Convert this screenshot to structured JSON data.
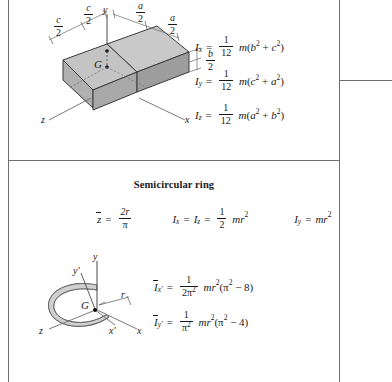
{
  "page": {
    "panels": [
      {
        "id": "rectangular-prism",
        "title": "",
        "figure": {
          "axis_labels": [
            "y",
            "z",
            "x"
          ],
          "centroid_label": "G",
          "dimensions": [
            {
              "label": "c/2",
              "num": "c",
              "den": "2"
            },
            {
              "label": "c/2",
              "num": "c",
              "den": "2"
            },
            {
              "label": "a/2",
              "num": "a",
              "den": "2"
            },
            {
              "label": "a/2",
              "num": "a",
              "den": "2"
            },
            {
              "label": "b/2",
              "num": "b",
              "den": "2"
            }
          ],
          "colors": {
            "top_face": "#c9c9c9",
            "left_face": "#b0b0b0",
            "front_face": "#a3a3a3",
            "outline": "#3a3a3a"
          }
        },
        "formulas": [
          {
            "lhs": "I",
            "sub": "x",
            "coef_num": "1",
            "coef_den": "12",
            "rhs": "m(b2 + c2)"
          },
          {
            "lhs": "I",
            "sub": "y",
            "coef_num": "1",
            "coef_den": "12",
            "rhs": "m(c2 + a2)"
          },
          {
            "lhs": "I",
            "sub": "z",
            "coef_num": "1",
            "coef_den": "12",
            "rhs": "m(a2 + b2)"
          }
        ]
      },
      {
        "id": "semicircular-ring",
        "title": "Semicircular ring",
        "figure": {
          "axis_labels": [
            "y",
            "y'",
            "z",
            "x'",
            "x"
          ],
          "centroid_label": "G",
          "radius_label": "r",
          "colors": {
            "band_fill": "#d0d0d0",
            "outline": "#555555"
          }
        },
        "row1": [
          {
            "lhs": "z",
            "overbar": true,
            "num": "2r",
            "den": "π"
          },
          {
            "lhs": "Ix = Iz",
            "num": "1",
            "den": "2",
            "rhs": "mr2"
          },
          {
            "lhs": "Iy",
            "rhs": "mr2"
          }
        ],
        "formulas": [
          {
            "lhs": "I",
            "sub": "x'",
            "overbar": true,
            "num": "1",
            "den": "2π2",
            "rhs": "mr2(π2 − 8)"
          },
          {
            "lhs": "I",
            "sub": "y'",
            "overbar": true,
            "num": "1",
            "den": "π2",
            "rhs": "mr2(π2 − 4)"
          }
        ]
      }
    ],
    "symbols": {
      "I": "I",
      "m": "m",
      "r": "r",
      "pi": "π",
      "equals": "=",
      "minus": "−",
      "x": "x",
      "y": "y",
      "z": "z",
      "x_prime": "x′",
      "y_prime": "y′",
      "a": "a",
      "b": "b",
      "c": "c",
      "two": "2",
      "twelve": "12",
      "one": "1",
      "eight": "8",
      "four": "4",
      "twopisq": "2π",
      "pisq": "π"
    }
  }
}
